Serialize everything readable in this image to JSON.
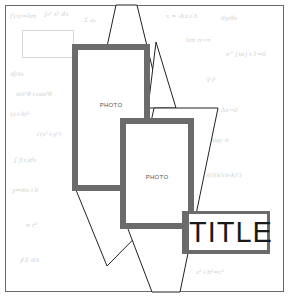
{
  "layout": {
    "name": "scrapbook-sketch",
    "colors": {
      "frame": "#6a6a6a",
      "photo_border": "#6b6b6b",
      "lines": "#222222",
      "background_pattern": "#cfcfcf",
      "title_text": "#1a1a1a"
    }
  },
  "background": {
    "pattern": "handwritten-math-formulas",
    "snippets": [
      "f'(x)=lim",
      "∫₀¹ x² dx",
      "Σ aₙ",
      "x = -b±√Δ",
      "dy/dx",
      "lim n→∞",
      "e^{iπ}+1=0",
      "∂f/∂x",
      "sin²θ+cos²θ",
      "(a+b)²",
      "√(x²+y²)",
      "∇·F",
      "Δx→0",
      "log₂ n",
      "∫ f(x)dx",
      "y=mx+b",
      "π r²",
      "n!/(k!(n-k)!)",
      "∮ E·dA",
      "a²+b²=c²"
    ]
  },
  "photos": [
    {
      "label": "PHOTO"
    },
    {
      "label": "PHOTO"
    }
  ],
  "title": {
    "label": "TITLE"
  }
}
